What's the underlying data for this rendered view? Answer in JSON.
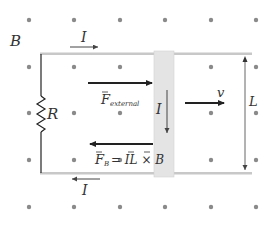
{
  "diagram": {
    "field_label": "B",
    "current_top_label": "I",
    "current_bottom_label": "I",
    "current_bar_label": "I",
    "resistor_label": "R",
    "velocity_label": "v",
    "length_label": "L",
    "force_external_main": "F",
    "force_external_sub": "external",
    "force_magnetic_main": "F",
    "force_magnetic_sub": "B",
    "force_magnetic_expr": "= IL × B",
    "colors": {
      "dots": "#8a8a8a",
      "rails": "#c8c8c8",
      "bar_fill": "#e4e4e4",
      "arrows": "#222222",
      "text": "#333333"
    }
  }
}
